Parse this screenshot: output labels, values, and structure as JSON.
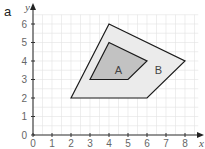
{
  "part_label": "a",
  "axes": {
    "x_label": "x",
    "y_label": "y",
    "x_ticks": [
      "0",
      "1",
      "2",
      "3",
      "4",
      "5",
      "6",
      "7",
      "8"
    ],
    "y_ticks": [
      "0",
      "1",
      "2",
      "3",
      "4",
      "5",
      "6"
    ],
    "x_range": [
      0,
      8
    ],
    "y_range": [
      0,
      6
    ]
  },
  "shapes": {
    "A": {
      "label": "A",
      "vertices": [
        [
          3,
          3
        ],
        [
          4,
          5
        ],
        [
          6,
          4
        ],
        [
          5,
          3
        ]
      ],
      "fill": "#c2c2c2"
    },
    "B": {
      "label": "B",
      "vertices": [
        [
          2,
          2
        ],
        [
          4,
          6
        ],
        [
          8,
          4
        ],
        [
          6,
          2
        ]
      ],
      "fill": "#ebebeb"
    }
  },
  "colors": {
    "grid": "#e2e2e2",
    "axis": "#333333",
    "outline": "#1a1a1a",
    "text": "#555555"
  }
}
